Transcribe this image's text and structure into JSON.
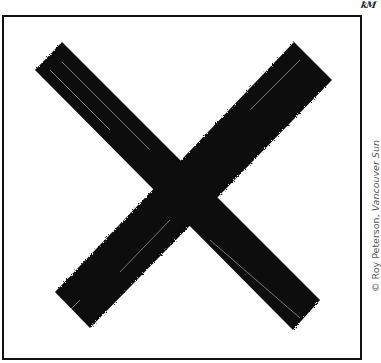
{
  "cartoon": {
    "signature": "ꝁM",
    "credit_prefix": "© Roy Peterson, ",
    "credit_publication": "Vancouver Sun",
    "symbol": "x-mark",
    "colors": {
      "ink": "#0a0a0a",
      "frame": "#111111",
      "background": "#ffffff",
      "credit_text": "#555555"
    }
  }
}
